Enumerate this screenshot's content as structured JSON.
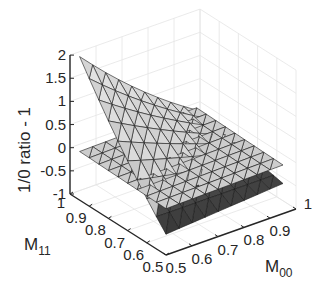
{
  "chart_data": {
    "type": "surface3d",
    "title": "",
    "xlabel": "M_00",
    "xlabel_main": "M",
    "xlabel_sub": "00",
    "ylabel": "M_11",
    "ylabel_main": "M",
    "ylabel_sub": "11",
    "zlabel": "1/0 ratio  - 1",
    "xlim": [
      0.5,
      1
    ],
    "ylim": [
      0.5,
      1
    ],
    "zlim": [
      -1,
      2
    ],
    "x_ticks": [
      "0.5",
      "0.6",
      "0.7",
      "0.8",
      "0.9",
      "1"
    ],
    "y_ticks": [
      "0.5",
      "0.6",
      "0.7",
      "0.8",
      "0.9",
      "1"
    ],
    "z_ticks": [
      "-1",
      "-0.5",
      "0",
      "0.5",
      "1",
      "1.5",
      "2"
    ],
    "grid": true,
    "view": "azimuth ~ -125°, elevation ~ 25°",
    "series": [
      {
        "name": "curved surface",
        "description": "rises to ~1.75 at M00=0.5, M11=0.95; drops to ~-0.6 at M00=0.5, M11=0.5; ~0 toward M00=0.95",
        "corners": {
          "M00_0.5_M11_0.5": -0.55,
          "M00_0.95_M11_0.5": -0.35,
          "M00_0.5_M11_0.95": 1.75,
          "M00_0.95_M11_0.95": 0.05
        }
      },
      {
        "name": "flat surface",
        "description": "nearly flat plane near z ≈ 0",
        "corners": {
          "M00_0.5_M11_0.5": 0.0,
          "M00_0.95_M11_0.5": 0.05,
          "M00_0.5_M11_0.95": 0.05,
          "M00_0.95_M11_0.95": 0.1
        }
      }
    ]
  }
}
